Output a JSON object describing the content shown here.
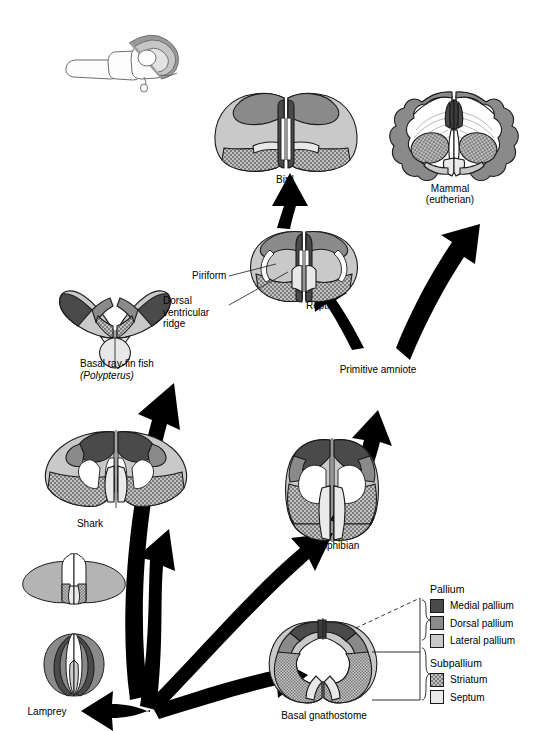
{
  "figure": {
    "type": "comparative-neuroanatomy-diagram",
    "title": "",
    "background": "#ffffff"
  },
  "colors": {
    "medial_pallium": "#4a4a4a",
    "dorsal_pallium": "#8a8a8a",
    "lateral_pallium": "#c9c9c9",
    "striatum_fill": "#b8b8b8",
    "septum": "#eaeaea",
    "white_matter": "#ffffff",
    "outline": "#1a1a1a",
    "arrow": "#000000",
    "inset_line": "#6e6e6e"
  },
  "inset": {
    "name": "brain-orientation-inset",
    "description": "line drawing of whole brain with shaded telencephalon"
  },
  "taxa": [
    {
      "id": "bird",
      "label": "Bird",
      "sub": ""
    },
    {
      "id": "mammal",
      "label": "Mammal",
      "sub": "(eutherian)"
    },
    {
      "id": "reptile",
      "label": "Reptile",
      "sub": ""
    },
    {
      "id": "rayfin",
      "label": "Basal ray-fin fish",
      "sub": "(Polypterus)"
    },
    {
      "id": "shark",
      "label": "Shark",
      "sub": ""
    },
    {
      "id": "amphibian",
      "label": "Amphibian",
      "sub": ""
    },
    {
      "id": "lamprey",
      "label": "Lamprey",
      "sub": ""
    },
    {
      "id": "gnathostome",
      "label": "Basal gnathostome",
      "sub": ""
    },
    {
      "id": "hagfish",
      "label": "",
      "sub": ""
    }
  ],
  "nodes": [
    {
      "id": "primitive_amniote",
      "label": "Primitive amniote"
    }
  ],
  "callouts": [
    {
      "id": "piriform",
      "label": "Piriform"
    },
    {
      "id": "dvr",
      "label": "Dorsal\nventricular\nridge"
    }
  ],
  "legend": {
    "groups": [
      {
        "id": "pallium",
        "title": "Pallium",
        "items": [
          {
            "id": "medial-pallium",
            "label": "Medial pallium",
            "color": "#4a4a4a",
            "pattern": "solid"
          },
          {
            "id": "dorsal-pallium",
            "label": "Dorsal pallium",
            "color": "#8a8a8a",
            "pattern": "solid"
          },
          {
            "id": "lateral-pallium",
            "label": "Lateral pallium",
            "color": "#c9c9c9",
            "pattern": "solid"
          }
        ]
      },
      {
        "id": "subpallium",
        "title": "Subpallium",
        "items": [
          {
            "id": "striatum",
            "label": "Striatum",
            "color": "#b8b8b8",
            "pattern": "stipple"
          },
          {
            "id": "septum",
            "label": "Septum",
            "color": "#eaeaea",
            "pattern": "solid"
          }
        ]
      }
    ]
  },
  "arrows": [
    {
      "id": "origin-to-rayfin",
      "from": "origin",
      "to": "rayfin"
    },
    {
      "id": "origin-to-shark",
      "from": "origin",
      "to": "shark"
    },
    {
      "id": "origin-to-lamprey",
      "from": "origin",
      "to": "lamprey"
    },
    {
      "id": "origin-to-amphibian",
      "from": "origin",
      "to": "amphibian"
    },
    {
      "id": "origin-to-gnathostome",
      "from": "origin",
      "to": "gnathostome"
    },
    {
      "id": "amphibian-to-amniote",
      "from": "amphibian",
      "to": "primitive_amniote"
    },
    {
      "id": "amniote-to-reptile",
      "from": "primitive_amniote",
      "to": "reptile"
    },
    {
      "id": "amniote-to-mammal",
      "from": "primitive_amniote",
      "to": "mammal"
    },
    {
      "id": "reptile-to-bird",
      "from": "reptile",
      "to": "bird"
    }
  ]
}
